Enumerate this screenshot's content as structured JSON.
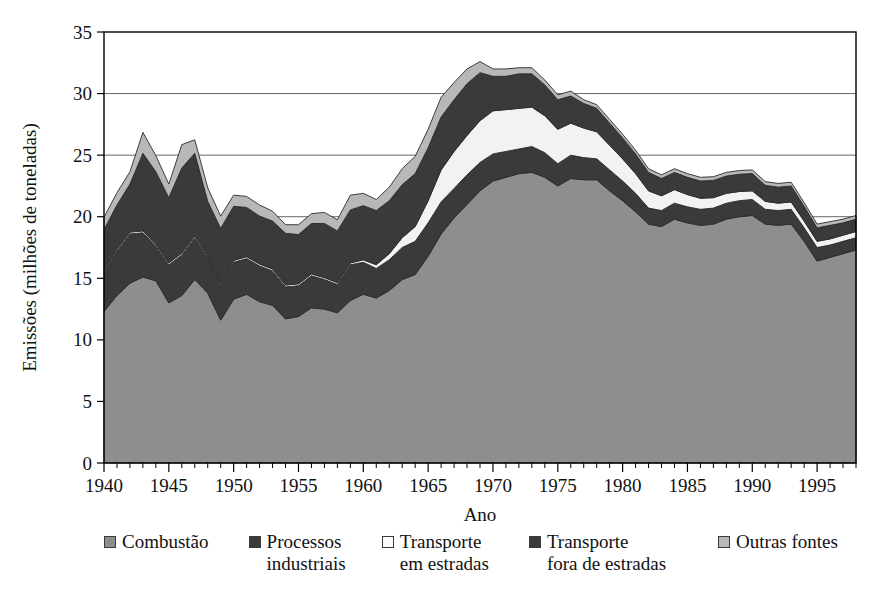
{
  "chart_data": {
    "type": "area",
    "stacked": true,
    "title": "",
    "subtitle": "",
    "xlabel": "Ano",
    "ylabel": "Emissões (milhões de toneladas)",
    "xlim": [
      1940,
      1998
    ],
    "ylim": [
      0,
      35
    ],
    "ytick_step": 5,
    "xtick_major_step": 5,
    "xtick_minor_step": 1,
    "grid": "horizontal",
    "legend_position": "bottom",
    "ytick_labels": [
      "0",
      "5",
      "10",
      "15",
      "20",
      "25",
      "30",
      "35"
    ],
    "xtick_labels": [
      "1940",
      "1945",
      "1950",
      "1955",
      "1960",
      "1965",
      "1970",
      "1975",
      "1980",
      "1985",
      "1990",
      "1995"
    ],
    "x": [
      1940,
      1941,
      1942,
      1943,
      1944,
      1945,
      1946,
      1947,
      1948,
      1949,
      1950,
      1951,
      1952,
      1953,
      1954,
      1955,
      1956,
      1957,
      1958,
      1959,
      1960,
      1961,
      1962,
      1963,
      1964,
      1965,
      1966,
      1967,
      1968,
      1969,
      1970,
      1971,
      1972,
      1973,
      1974,
      1975,
      1976,
      1977,
      1978,
      1979,
      1980,
      1981,
      1982,
      1983,
      1984,
      1985,
      1986,
      1987,
      1988,
      1989,
      1990,
      1991,
      1992,
      1993,
      1994,
      1995,
      1996,
      1997,
      1998
    ],
    "series": [
      {
        "name": "Combustão",
        "color": "#8e8e8e",
        "values": [
          12.3,
          13.6,
          14.6,
          15.1,
          14.8,
          13.0,
          13.6,
          14.9,
          13.8,
          11.6,
          13.3,
          13.7,
          13.1,
          12.8,
          11.7,
          11.9,
          12.6,
          12.5,
          12.2,
          13.2,
          13.7,
          13.4,
          14.0,
          14.9,
          15.3,
          16.8,
          18.6,
          19.9,
          21.0,
          22.1,
          22.9,
          23.2,
          23.5,
          23.6,
          23.2,
          22.5,
          23.1,
          23.0,
          23.0,
          22.1,
          21.3,
          20.4,
          19.4,
          19.2,
          19.8,
          19.5,
          19.3,
          19.4,
          19.8,
          20.0,
          20.1,
          19.4,
          19.3,
          19.4,
          18.0,
          16.4,
          16.7,
          17.0,
          17.3
        ]
      },
      {
        "name": "Processos industriais",
        "color": "#3a3a3a",
        "values": [
          3.2,
          3.6,
          4.0,
          3.6,
          2.8,
          3.1,
          3.3,
          3.4,
          2.9,
          2.8,
          3.0,
          2.9,
          2.9,
          2.8,
          2.6,
          2.5,
          2.6,
          2.4,
          2.3,
          2.9,
          2.6,
          2.4,
          2.5,
          2.6,
          2.7,
          2.7,
          2.6,
          2.4,
          2.4,
          2.3,
          2.2,
          2.1,
          2.0,
          2.1,
          2.0,
          1.8,
          1.9,
          1.8,
          1.7,
          1.7,
          1.6,
          1.5,
          1.3,
          1.3,
          1.3,
          1.3,
          1.3,
          1.3,
          1.3,
          1.3,
          1.3,
          1.2,
          1.2,
          1.2,
          1.1,
          1.1,
          1.0,
          1.0,
          1.0
        ]
      },
      {
        "name": "Transporte em estradas",
        "color": "#f2f2f2",
        "values": [
          0.15,
          0.15,
          0.15,
          0.15,
          0.15,
          0.15,
          0.15,
          0.15,
          0.15,
          0.15,
          0.15,
          0.15,
          0.15,
          0.15,
          0.15,
          0.15,
          0.15,
          0.15,
          0.15,
          0.15,
          0.2,
          0.3,
          0.5,
          0.8,
          1.2,
          1.8,
          2.6,
          3.0,
          3.2,
          3.4,
          3.5,
          3.4,
          3.3,
          3.2,
          3.0,
          2.8,
          2.6,
          2.4,
          2.2,
          2.0,
          1.8,
          1.6,
          1.4,
          1.2,
          1.1,
          1.0,
          0.9,
          0.85,
          0.8,
          0.75,
          0.7,
          0.65,
          0.6,
          0.6,
          0.55,
          0.5,
          0.5,
          0.5,
          0.5
        ]
      },
      {
        "name": "Transporte fora de estradas",
        "color": "#3a3a3a",
        "values": [
          3.3,
          3.6,
          3.9,
          6.3,
          5.9,
          5.3,
          6.9,
          6.7,
          4.4,
          4.5,
          4.4,
          4.0,
          3.9,
          3.9,
          4.2,
          4.0,
          4.1,
          4.4,
          4.2,
          4.3,
          4.4,
          4.4,
          4.3,
          4.3,
          4.3,
          4.3,
          4.3,
          4.2,
          4.2,
          3.9,
          2.8,
          2.7,
          2.8,
          2.7,
          2.5,
          2.4,
          2.2,
          2.0,
          1.9,
          1.8,
          1.7,
          1.6,
          1.5,
          1.4,
          1.4,
          1.4,
          1.4,
          1.4,
          1.4,
          1.4,
          1.4,
          1.3,
          1.3,
          1.3,
          1.2,
          1.1,
          1.1,
          1.0,
          1.0
        ]
      },
      {
        "name": "Outras fontes",
        "color": "#b8b8b8",
        "values": [
          1.0,
          1.0,
          1.0,
          1.7,
          1.3,
          1.1,
          1.9,
          1.1,
          1.1,
          1.0,
          0.9,
          0.9,
          0.9,
          0.8,
          0.7,
          0.8,
          0.8,
          0.9,
          0.9,
          1.2,
          1.0,
          0.9,
          1.1,
          1.3,
          1.4,
          1.5,
          1.6,
          1.4,
          1.2,
          0.9,
          0.6,
          0.6,
          0.5,
          0.5,
          0.4,
          0.4,
          0.4,
          0.3,
          0.3,
          0.3,
          0.3,
          0.3,
          0.3,
          0.3,
          0.3,
          0.3,
          0.3,
          0.3,
          0.3,
          0.3,
          0.3,
          0.3,
          0.3,
          0.3,
          0.3,
          0.3,
          0.3,
          0.3,
          0.3
        ]
      }
    ]
  },
  "legend": {
    "items": [
      {
        "label_line1": "Combustão",
        "label_line2": "",
        "color": "#8e8e8e"
      },
      {
        "label_line1": "Processos",
        "label_line2": "industriais",
        "color": "#3a3a3a"
      },
      {
        "label_line1": "Transporte",
        "label_line2": "em estradas",
        "color": "#fbfbfb"
      },
      {
        "label_line1": "Transporte",
        "label_line2": "fora de estradas",
        "color": "#3a3a3a"
      },
      {
        "label_line1": "Outras fontes",
        "label_line2": "",
        "color": "#b8b8b8"
      }
    ]
  },
  "colors": {
    "plot_border": "#000000",
    "gridline": "#555555",
    "background": "#ffffff",
    "text": "#111111"
  }
}
